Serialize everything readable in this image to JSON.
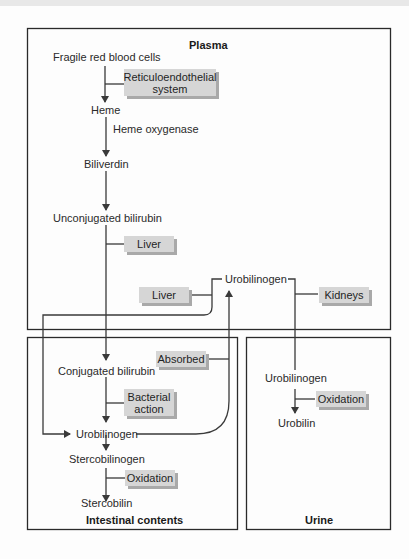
{
  "diagram": {
    "type": "flow",
    "regions": {
      "plasma": "Plasma",
      "intestinal": "Intestinal contents",
      "urine": "Urine"
    },
    "nodes": {
      "fragile_rbc": "Fragile red blood cells",
      "heme": "Heme",
      "heme_oxygenase": "Heme oxygenase",
      "biliverdin": "Biliverdin",
      "unconjugated_bilirubin": "Unconjugated bilirubin",
      "urobilinogen_plasma": "Urobilinogen",
      "conjugated_bilirubin": "Conjugated bilirubin",
      "urobilinogen_intestinal": "Urobilinogen",
      "stercobilinogen": "Stercobilinogen",
      "stercobilin": "Stercobilin",
      "urobilinogen_urine": "Urobilinogen",
      "urobilin": "Urobilin"
    },
    "process_boxes": {
      "reticuloendothelial": "Reticuloendothelial system",
      "liver_1": "Liver",
      "liver_2": "Liver",
      "kidneys": "Kidneys",
      "absorbed": "Absorbed",
      "bacterial_action": "Bacterial action",
      "oxidation_intestinal": "Oxidation",
      "oxidation_urine": "Oxidation"
    },
    "colors": {
      "box_fill": "#d6d6d6",
      "box_shadow": "#a9a9a9",
      "line": "#3a3a3a"
    }
  }
}
